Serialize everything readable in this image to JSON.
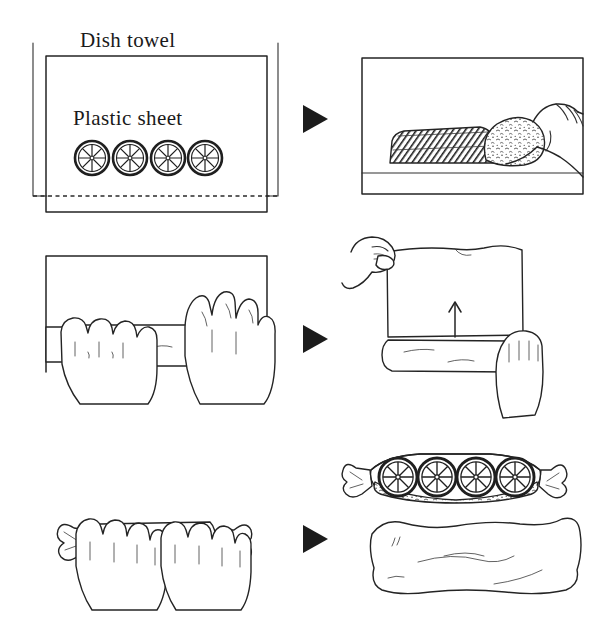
{
  "figure": {
    "kind": "instructional-line-drawing",
    "title_visible": false,
    "background_color": "#ffffff",
    "ink_color": "#242424",
    "columns": 2,
    "rows": 3,
    "step_count": 6,
    "flow_marker_count": 3
  },
  "labels": {
    "dish_towel": "Dish towel",
    "plastic_sheet": "Plastic sheet"
  },
  "panels": [
    {
      "id": "step-1",
      "position": "row1-left",
      "description": "Overhead view of a dish towel with a plastic sheet on top and four citrus slices arranged in a row",
      "citrus_slice_count": 4,
      "has_dashed_plastic_edge": true,
      "labels": [
        "Dish towel",
        "Plastic sheet"
      ]
    },
    {
      "id": "step-2",
      "position": "row1-right",
      "description": "A hand presses a crumb-coated filling against a dark hatched log on the sheet",
      "has_hand": true,
      "hand_count": 1,
      "labels": []
    },
    {
      "id": "step-3",
      "position": "row2-left",
      "description": "Two hands roll the cylindrical log forward across the sheet",
      "has_hand": true,
      "hand_count": 2,
      "labels": []
    },
    {
      "id": "step-4",
      "position": "row2-right",
      "description": "Two hands lift the near edge of the sheet upward over the log; an up arrow shows lift direction",
      "has_hand": true,
      "hand_count": 2,
      "has_up_arrow": true,
      "labels": []
    },
    {
      "id": "step-5",
      "position": "row3-left",
      "description": "Two hands hold the finished roll wrapped in plastic with twisted candy-wrapper ends",
      "has_hand": true,
      "hand_count": 2,
      "labels": []
    },
    {
      "id": "step-6a",
      "position": "row3-right-upper",
      "description": "Cutaway of the wrapped roll showing four citrus slices embedded in the filling, twisted ends at both sides",
      "citrus_slice_count": 4,
      "labels": []
    },
    {
      "id": "step-6b",
      "position": "row3-right-lower",
      "description": "The finished roll fully enclosed in the dish towel",
      "labels": []
    }
  ],
  "flow_markers": [
    {
      "id": "arrow-row-1",
      "glyph": "▶",
      "direction": "right"
    },
    {
      "id": "arrow-row-2",
      "glyph": "▶",
      "direction": "right"
    },
    {
      "id": "arrow-row-3",
      "glyph": "▶",
      "direction": "right"
    }
  ],
  "annotations": [
    {
      "id": "lift-arrow",
      "direction": "up",
      "panel": "step-4"
    }
  ]
}
